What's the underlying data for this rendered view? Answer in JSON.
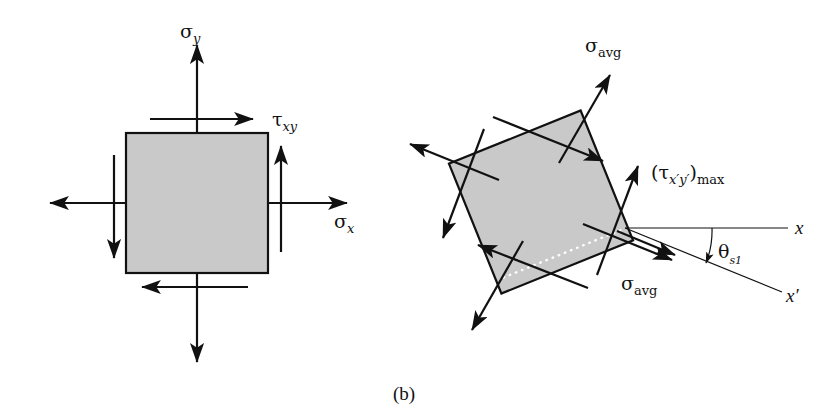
{
  "figure": {
    "caption": "(b)",
    "background_color": "#ffffff",
    "element_fill_color": "#c9c9c9",
    "line_color": "#111111"
  },
  "left_element": {
    "name": "original-stress-element",
    "description": "Axis-aligned square stress element with normal and shear stresses",
    "rotation_deg": 0,
    "labels": {
      "sigma_y": {
        "symbol": "σ",
        "subscript": "y",
        "text": "σy"
      },
      "sigma_x": {
        "symbol": "σ",
        "subscript": "x",
        "text": "σx"
      },
      "tau_xy": {
        "symbol": "τ",
        "subscript": "xy",
        "text": "τxy"
      }
    },
    "arrows": [
      {
        "name": "sigma-y-up-arrow",
        "kind": "normal-stress",
        "direction": "up"
      },
      {
        "name": "sigma-y-down-arrow",
        "kind": "normal-stress",
        "direction": "down"
      },
      {
        "name": "sigma-x-right-arrow",
        "kind": "normal-stress",
        "direction": "right"
      },
      {
        "name": "sigma-x-left-arrow",
        "kind": "normal-stress",
        "direction": "left"
      },
      {
        "name": "tau-top-shear-arrow",
        "kind": "shear-stress",
        "direction": "right"
      },
      {
        "name": "tau-bottom-shear-arrow",
        "kind": "shear-stress",
        "direction": "left"
      },
      {
        "name": "tau-right-shear-arrow",
        "kind": "shear-stress",
        "direction": "up"
      },
      {
        "name": "tau-left-shear-arrow",
        "kind": "shear-stress",
        "direction": "down"
      }
    ]
  },
  "right_element": {
    "name": "max-shear-stress-element",
    "description": "Rotated square element oriented for maximum in-plane shear stress",
    "rotation_deg": -22,
    "labels": {
      "sigma_avg_top": {
        "symbol": "σ",
        "subscript": "avg",
        "text": "σavg"
      },
      "sigma_avg_bottom": {
        "symbol": "σ",
        "subscript": "avg",
        "text": "σavg"
      },
      "tau_max": {
        "text": "(τx′y′)max",
        "open_paren": "(",
        "symbol": "τ",
        "subscript": "x′y′",
        "close_paren": ")",
        "post_subscript": "max"
      },
      "theta_s1": {
        "symbol": "θ",
        "subscript": "s1",
        "text": "θs1"
      },
      "axis_x": "x",
      "axis_x_prime": "x′"
    },
    "arrows": [
      {
        "name": "sigma-avg-upper-right-arrow",
        "kind": "normal-stress",
        "direction": "up-right"
      },
      {
        "name": "sigma-avg-lower-left-arrow",
        "kind": "normal-stress",
        "direction": "down-left"
      },
      {
        "name": "sigma-avg-upper-left-arrow",
        "kind": "normal-stress",
        "direction": "up-left"
      },
      {
        "name": "sigma-avg-lower-right-arrow",
        "kind": "normal-stress",
        "direction": "down-right"
      },
      {
        "name": "tau-max-top-shear-arrow",
        "kind": "shear-stress",
        "direction": "down-right"
      },
      {
        "name": "tau-max-bottom-shear-arrow",
        "kind": "shear-stress",
        "direction": "up-left"
      },
      {
        "name": "tau-max-right-shear-arrow",
        "kind": "shear-stress",
        "direction": "up-right"
      },
      {
        "name": "tau-max-left-shear-arrow",
        "kind": "shear-stress",
        "direction": "down-left"
      }
    ],
    "angle_arc": {
      "name": "theta-s1-arc",
      "from_axis": "x",
      "to_axis": "x′",
      "value_deg": 22
    },
    "dotted_reference_line": {
      "name": "dotted-reference-line",
      "style": "white dotted"
    }
  }
}
